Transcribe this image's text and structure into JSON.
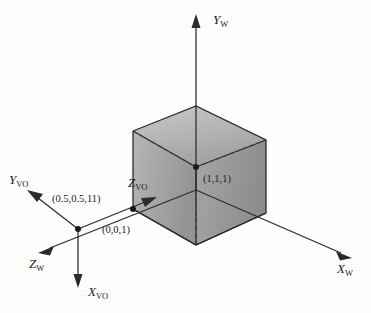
{
  "figure": {
    "background_color": "#fdfdfc",
    "line_color": "#2b2b2b"
  },
  "axes": [
    {
      "id": "y-world",
      "label": "Y",
      "subscript": "W",
      "direction": "up"
    },
    {
      "id": "x-world",
      "label": "X",
      "subscript": "W",
      "direction": "down-right"
    },
    {
      "id": "z-world",
      "label": "Z",
      "subscript": "W",
      "direction": "down-left"
    },
    {
      "id": "x-vo",
      "label": "X",
      "subscript": "VO",
      "direction": "down"
    },
    {
      "id": "y-vo",
      "label": "Y",
      "subscript": "VO",
      "direction": "up-left"
    },
    {
      "id": "z-vo",
      "label": "Z",
      "subscript": "VO",
      "direction": "right"
    }
  ],
  "points": [
    {
      "id": "cube-center",
      "label": "(1,1,1)"
    },
    {
      "id": "cube-origin",
      "label": "(0,0,1)"
    },
    {
      "id": "vo-origin",
      "label": "(0.5,0.5,11)"
    }
  ],
  "cube": {
    "fill_left": "#a8a8a8",
    "fill_right": "#9a9a9a",
    "fill_top": "#c2c2c2",
    "edge_color": "#2b2b2b"
  }
}
